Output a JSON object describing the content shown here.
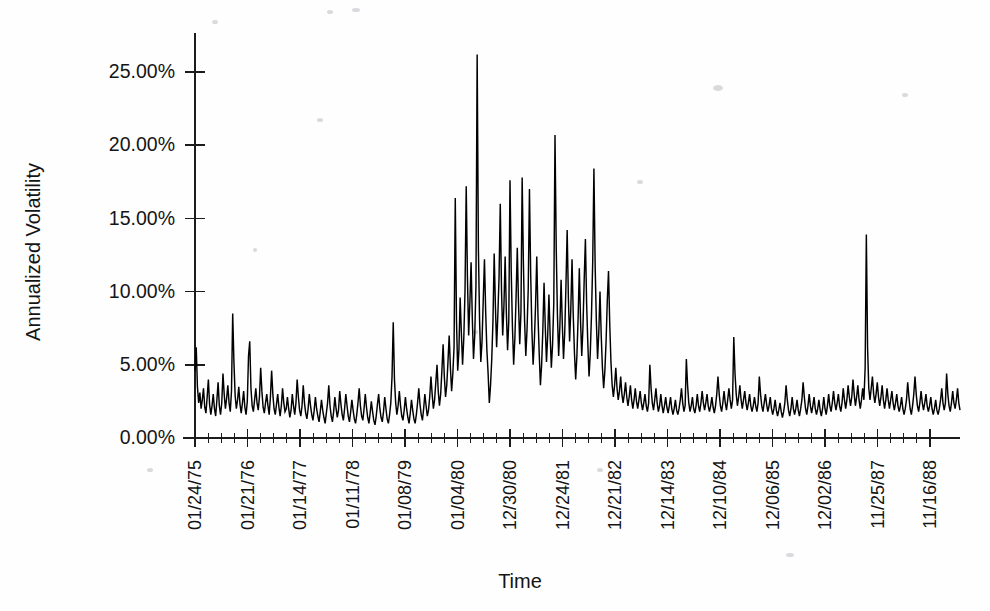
{
  "figure": {
    "background_color": "#fefefe",
    "line_color": "#000000",
    "axis_color": "#1c1c1c"
  },
  "chart_data": {
    "type": "line",
    "title": "",
    "xlabel": "Time",
    "ylabel": "Annualized Volatility",
    "ylim": [
      0,
      27.5
    ],
    "ytick_values": [
      0,
      5,
      10,
      15,
      20,
      25
    ],
    "ytick_labels": [
      "0.00%",
      "5.00%",
      "10.00%",
      "15.00%",
      "20.00%",
      "25.00%"
    ],
    "grid": false,
    "legend": "none",
    "x_tick_labels": [
      "01/24/75",
      "01/21/76",
      "01/14/77",
      "01/11/78",
      "01/08/79",
      "01/04/80",
      "12/30/80",
      "12/24/81",
      "12/21/82",
      "12/14/83",
      "12/10/84",
      "12/06/85",
      "12/02/86",
      "11/25/87",
      "11/16/88"
    ],
    "x_minor_ticks_per_major": 4,
    "series_name": "Annualized Volatility",
    "units": "percent",
    "values": [
      4.6,
      6.2,
      3.5,
      2.4,
      3.1,
      2.0,
      2.6,
      3.4,
      2.1,
      1.7,
      2.8,
      4.0,
      2.3,
      1.6,
      2.2,
      3.0,
      2.0,
      1.5,
      2.6,
      3.8,
      2.2,
      1.6,
      2.4,
      4.4,
      3.0,
      2.0,
      2.7,
      3.6,
      2.4,
      1.8,
      3.2,
      8.5,
      5.2,
      2.9,
      2.0,
      2.6,
      3.5,
      2.3,
      1.7,
      2.4,
      3.2,
      2.1,
      1.6,
      2.5,
      5.6,
      6.6,
      3.4,
      2.2,
      1.8,
      2.6,
      3.4,
      2.4,
      1.9,
      2.8,
      4.8,
      3.2,
      2.1,
      1.7,
      2.4,
      3.0,
      2.2,
      1.6,
      2.8,
      4.6,
      3.0,
      2.0,
      1.6,
      2.3,
      3.0,
      2.1,
      1.5,
      2.2,
      3.4,
      2.4,
      1.8,
      2.0,
      2.8,
      2.0,
      1.4,
      1.9,
      3.0,
      2.2,
      1.6,
      2.4,
      4.0,
      2.8,
      1.9,
      1.5,
      2.2,
      3.6,
      2.4,
      1.7,
      1.3,
      2.0,
      3.0,
      2.2,
      1.6,
      1.2,
      1.9,
      2.8,
      2.0,
      1.5,
      1.1,
      1.8,
      2.6,
      1.9,
      1.4,
      1.0,
      1.7,
      2.4,
      3.6,
      2.2,
      1.5,
      1.1,
      1.8,
      2.8,
      2.0,
      1.4,
      1.9,
      3.2,
      2.3,
      1.6,
      1.2,
      2.0,
      3.0,
      2.2,
      1.5,
      1.1,
      1.8,
      2.6,
      1.9,
      1.3,
      1.0,
      1.6,
      2.4,
      3.4,
      2.2,
      1.5,
      1.2,
      2.0,
      3.0,
      2.1,
      1.4,
      1.0,
      1.7,
      2.5,
      1.8,
      1.2,
      0.9,
      1.5,
      2.3,
      3.0,
      2.0,
      1.4,
      1.1,
      1.8,
      2.8,
      2.0,
      1.3,
      1.0,
      1.6,
      2.4,
      4.2,
      7.9,
      4.0,
      2.4,
      1.6,
      2.2,
      3.2,
      2.2,
      1.5,
      1.2,
      1.9,
      2.8,
      2.0,
      1.4,
      1.0,
      1.7,
      2.6,
      1.9,
      1.3,
      1.0,
      1.6,
      2.4,
      3.4,
      2.3,
      1.6,
      1.2,
      2.0,
      3.0,
      2.2,
      1.5,
      1.9,
      2.8,
      4.2,
      3.0,
      2.0,
      2.6,
      3.8,
      5.0,
      3.2,
      2.2,
      3.0,
      4.6,
      6.4,
      4.2,
      2.8,
      3.6,
      5.2,
      7.0,
      4.8,
      3.2,
      4.4,
      6.2,
      16.4,
      8.0,
      4.6,
      6.0,
      9.6,
      7.2,
      5.0,
      6.8,
      10.0,
      17.2,
      11.0,
      7.0,
      9.2,
      12.0,
      8.2,
      5.4,
      7.0,
      10.4,
      26.2,
      13.0,
      8.0,
      5.2,
      6.6,
      9.4,
      12.2,
      8.6,
      6.0,
      4.4,
      2.4,
      3.6,
      5.4,
      8.0,
      12.6,
      9.0,
      6.2,
      8.4,
      11.0,
      16.0,
      10.2,
      7.0,
      9.0,
      12.4,
      8.6,
      6.0,
      8.0,
      17.6,
      11.4,
      7.6,
      5.0,
      6.8,
      9.6,
      13.0,
      9.2,
      6.4,
      8.6,
      17.8,
      12.0,
      8.0,
      5.6,
      7.4,
      10.2,
      17.0,
      11.2,
      7.4,
      5.0,
      6.6,
      9.0,
      12.4,
      8.4,
      5.8,
      3.6,
      5.0,
      7.4,
      10.6,
      7.6,
      5.2,
      7.0,
      9.8,
      7.0,
      4.8,
      6.4,
      9.2,
      20.7,
      13.0,
      8.4,
      5.6,
      7.6,
      10.8,
      7.8,
      5.4,
      7.2,
      10.4,
      14.2,
      9.6,
      6.6,
      8.8,
      12.2,
      8.4,
      5.8,
      4.0,
      5.6,
      8.2,
      11.6,
      8.0,
      5.6,
      7.6,
      10.8,
      13.6,
      9.2,
      6.4,
      4.2,
      5.8,
      8.4,
      12.0,
      18.4,
      11.8,
      8.0,
      5.4,
      7.2,
      10.0,
      7.0,
      4.8,
      3.4,
      4.6,
      6.6,
      9.4,
      11.4,
      7.8,
      5.2,
      3.6,
      2.8,
      3.6,
      4.8,
      3.4,
      2.6,
      3.2,
      4.2,
      3.0,
      2.4,
      3.0,
      3.8,
      2.8,
      2.2,
      2.8,
      3.6,
      2.6,
      2.0,
      2.6,
      3.4,
      2.5,
      2.0,
      2.6,
      3.2,
      2.4,
      1.9,
      2.4,
      3.0,
      2.2,
      1.8,
      2.4,
      5.0,
      3.4,
      2.4,
      1.9,
      2.6,
      3.4,
      2.4,
      1.8,
      2.2,
      3.0,
      2.2,
      1.7,
      2.2,
      2.8,
      2.1,
      1.7,
      2.2,
      2.8,
      2.0,
      1.6,
      2.0,
      2.6,
      1.9,
      1.6,
      2.0,
      2.6,
      3.4,
      2.4,
      1.8,
      2.2,
      5.4,
      3.6,
      2.4,
      1.8,
      2.2,
      2.8,
      2.0,
      1.7,
      2.2,
      3.0,
      2.2,
      1.8,
      2.4,
      3.2,
      2.4,
      1.9,
      2.4,
      3.0,
      2.2,
      1.8,
      2.2,
      2.8,
      2.1,
      1.7,
      2.2,
      3.0,
      4.2,
      3.0,
      2.2,
      1.8,
      2.4,
      3.2,
      2.4,
      1.9,
      2.6,
      3.4,
      2.6,
      2.0,
      2.6,
      6.9,
      4.4,
      3.0,
      2.2,
      2.8,
      3.6,
      2.6,
      2.0,
      2.6,
      3.2,
      2.4,
      1.9,
      2.4,
      3.0,
      2.2,
      1.8,
      2.2,
      2.8,
      2.2,
      1.8,
      2.4,
      4.2,
      3.0,
      2.2,
      1.8,
      2.4,
      3.0,
      2.3,
      1.8,
      2.2,
      2.8,
      2.0,
      1.6,
      2.0,
      2.6,
      1.9,
      1.5,
      1.9,
      2.4,
      1.8,
      1.4,
      1.8,
      2.4,
      3.6,
      2.6,
      1.9,
      1.5,
      2.0,
      2.8,
      2.0,
      1.6,
      2.0,
      2.6,
      1.9,
      1.5,
      2.0,
      2.6,
      3.8,
      2.8,
      2.0,
      1.6,
      2.2,
      3.0,
      2.2,
      1.7,
      2.2,
      2.8,
      2.0,
      1.6,
      2.0,
      2.6,
      1.9,
      1.5,
      2.0,
      2.8,
      2.0,
      1.6,
      2.2,
      3.0,
      2.2,
      1.8,
      2.4,
      3.2,
      2.4,
      1.9,
      2.4,
      3.0,
      2.2,
      1.8,
      2.4,
      3.4,
      2.6,
      2.0,
      2.6,
      3.6,
      2.8,
      2.2,
      2.8,
      4.0,
      3.0,
      2.2,
      2.8,
      3.6,
      2.6,
      2.0,
      2.6,
      3.4,
      2.6,
      4.8,
      13.9,
      6.2,
      3.4,
      2.6,
      3.4,
      4.2,
      3.0,
      2.4,
      3.0,
      3.8,
      2.8,
      2.2,
      2.8,
      3.6,
      2.6,
      2.0,
      2.6,
      3.4,
      2.6,
      2.0,
      2.6,
      3.2,
      2.4,
      1.9,
      2.4,
      3.0,
      2.2,
      1.8,
      2.2,
      2.8,
      2.0,
      1.6,
      2.0,
      2.6,
      3.8,
      2.8,
      2.0,
      1.6,
      2.2,
      3.0,
      4.2,
      3.0,
      2.2,
      1.8,
      2.4,
      3.2,
      2.4,
      1.9,
      2.4,
      3.0,
      2.2,
      1.8,
      2.2,
      2.8,
      2.0,
      1.6,
      2.0,
      2.6,
      1.9,
      1.6,
      2.0,
      2.6,
      3.4,
      2.4,
      1.9,
      2.4,
      4.4,
      3.0,
      2.2,
      1.8,
      2.4,
      3.2,
      2.4,
      2.0,
      2.6,
      3.4,
      2.4,
      1.9
    ]
  }
}
